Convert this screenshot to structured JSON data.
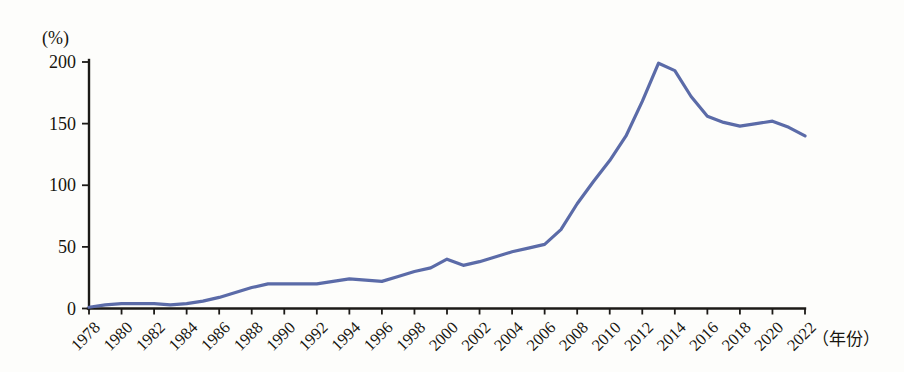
{
  "chart_data": {
    "type": "line",
    "title": "",
    "subtitle": "",
    "xlabel": "（年份）",
    "ylabel": "(%)",
    "unit_label": "(%)",
    "grid": false,
    "legend": null,
    "legend_position": "none",
    "line_color": "#5b6ba8",
    "axis_color": "#1c1a17",
    "background_color": "#fdfdfb",
    "xlim": [
      1978,
      2022
    ],
    "ylim": [
      0,
      200
    ],
    "ytick_labels": [
      "0",
      "50",
      "100",
      "150",
      "200"
    ],
    "ytick_values": [
      0,
      50,
      100,
      150,
      200
    ],
    "xtick_labels": [
      "1978",
      "1980",
      "1982",
      "1984",
      "1986",
      "1988",
      "1990",
      "1992",
      "1994",
      "1996",
      "1998",
      "2000",
      "2002",
      "2004",
      "2006",
      "2008",
      "2010",
      "2012",
      "2014",
      "2016",
      "2018",
      "2020",
      "2022"
    ],
    "xtick_values": [
      1978,
      1980,
      1982,
      1984,
      1986,
      1988,
      1990,
      1992,
      1994,
      1996,
      1998,
      2000,
      2002,
      2004,
      2006,
      2008,
      2010,
      2012,
      2014,
      2016,
      2018,
      2020,
      2022
    ],
    "x": [
      1978,
      1979,
      1980,
      1981,
      1982,
      1983,
      1984,
      1985,
      1986,
      1987,
      1988,
      1989,
      1990,
      1991,
      1992,
      1993,
      1994,
      1995,
      1996,
      1997,
      1998,
      1999,
      2000,
      2001,
      2002,
      2003,
      2004,
      2005,
      2006,
      2007,
      2008,
      2009,
      2010,
      2011,
      2012,
      2013,
      2014,
      2015,
      2016,
      2017,
      2018,
      2019,
      2020,
      2021,
      2022
    ],
    "values": [
      1,
      3,
      4,
      4,
      4,
      3,
      4,
      6,
      9,
      13,
      17,
      20,
      20,
      20,
      20,
      22,
      24,
      23,
      22,
      26,
      30,
      33,
      40,
      35,
      38,
      42,
      46,
      49,
      52,
      64,
      85,
      103,
      120,
      140,
      168,
      199,
      193,
      172,
      156,
      151,
      148,
      150,
      152,
      147,
      140
    ],
    "series": [
      {
        "name": "",
        "values": [
          1,
          3,
          4,
          4,
          4,
          3,
          4,
          6,
          9,
          13,
          17,
          20,
          20,
          20,
          20,
          22,
          24,
          23,
          22,
          26,
          30,
          33,
          40,
          35,
          38,
          42,
          46,
          49,
          52,
          64,
          85,
          103,
          120,
          140,
          168,
          199,
          193,
          172,
          156,
          151,
          148,
          150,
          152,
          147,
          140
        ]
      }
    ],
    "annotations": []
  }
}
